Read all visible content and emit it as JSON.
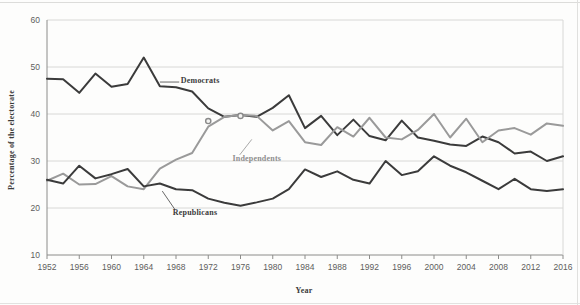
{
  "chart_data": {
    "type": "line",
    "title": "",
    "xlabel": "Year",
    "ylabel": "Percentage of the electorate",
    "xlim": [
      1952,
      2016
    ],
    "ylim": [
      10,
      60
    ],
    "yticks": [
      10,
      20,
      30,
      40,
      50,
      60
    ],
    "xticks": [
      1952,
      1956,
      1960,
      1964,
      1968,
      1972,
      1976,
      1980,
      1984,
      1988,
      1992,
      1996,
      2000,
      2004,
      2008,
      2012,
      2016
    ],
    "grid": "horizontal",
    "legend_position": "inline-annotations",
    "x": [
      1952,
      1954,
      1956,
      1958,
      1960,
      1962,
      1964,
      1966,
      1968,
      1970,
      1972,
      1974,
      1976,
      1978,
      1980,
      1982,
      1984,
      1986,
      1988,
      1990,
      1992,
      1994,
      1996,
      1998,
      2000,
      2002,
      2004,
      2006,
      2008,
      2010,
      2012,
      2014,
      2016
    ],
    "series": [
      {
        "name": "Democrats",
        "color": "#3b3b3b",
        "values": [
          47.5,
          47.4,
          44.5,
          48.6,
          45.8,
          46.4,
          52.0,
          45.9,
          45.7,
          44.8,
          41.2,
          39.4,
          39.8,
          39.4,
          41.3,
          44.0,
          37.0,
          39.6,
          35.5,
          38.8,
          35.3,
          34.4,
          38.6,
          35.0,
          34.3,
          33.5,
          33.2,
          35.2,
          34.0,
          31.6,
          32.0,
          30.0,
          31.0
        ]
      },
      {
        "name": "Independents",
        "color": "#9a9a9a",
        "values": [
          25.8,
          27.3,
          25.0,
          25.1,
          26.8,
          24.6,
          24.0,
          28.4,
          30.3,
          31.7,
          37.3,
          39.4,
          39.8,
          39.6,
          36.5,
          38.5,
          34.0,
          33.4,
          37.2,
          35.2,
          39.2,
          35.0,
          34.6,
          36.6,
          40.0,
          35.0,
          39.0,
          34.0,
          36.5,
          37.0,
          35.6,
          38.0,
          37.5
        ]
      },
      {
        "name": "Republicans",
        "color": "#3b3b3b",
        "values": [
          26.0,
          25.2,
          29.0,
          26.3,
          27.2,
          28.3,
          24.6,
          25.2,
          24.0,
          23.8,
          22.0,
          21.1,
          20.5,
          21.2,
          22.0,
          24.0,
          28.2,
          26.6,
          27.8,
          26.0,
          25.2,
          30.0,
          27.0,
          27.8,
          31.0,
          29.0,
          27.6,
          25.8,
          24.0,
          26.2,
          24.0,
          23.6,
          24.0
        ]
      }
    ],
    "annotations": [
      {
        "name": "Democrats",
        "x": 1967,
        "y": 47.4,
        "color": "#3b3b3b",
        "leader": true
      },
      {
        "name": "Independents",
        "x": 1978.5,
        "y": 31.5,
        "color": "#8f8f8f",
        "leader": true
      },
      {
        "name": "Republicans",
        "x": 1968.5,
        "y": 19.0,
        "color": "#3b3b3b",
        "leader": true
      }
    ],
    "markers": [
      {
        "x": 1972,
        "y": 38.5
      },
      {
        "x": 1976,
        "y": 39.6
      }
    ]
  },
  "labels": {
    "y_axis_title": "Percentage of the electorate",
    "x_axis_title": "Year",
    "series_democrats": "Democrats",
    "series_independents": "Independents",
    "series_republicans": "Republicans",
    "ytick_10": "10",
    "ytick_20": "20",
    "ytick_30": "30",
    "ytick_40": "40",
    "ytick_50": "50",
    "ytick_60": "60",
    "xtick_1952": "1952",
    "xtick_1956": "1956",
    "xtick_1960": "1960",
    "xtick_1964": "1964",
    "xtick_1968": "1968",
    "xtick_1972": "1972",
    "xtick_1976": "1976",
    "xtick_1980": "1980",
    "xtick_1984": "1984",
    "xtick_1988": "1988",
    "xtick_1992": "1992",
    "xtick_1996": "1996",
    "xtick_2000": "2000",
    "xtick_2004": "2004",
    "xtick_2008": "2008",
    "xtick_2012": "2012",
    "xtick_2016": "2016"
  },
  "colors": {
    "dark_line": "#3b3b3b",
    "light_line": "#9a9a9a",
    "grid": "#d8d8d6",
    "axis": "#8c8c8a",
    "background": "#fdfdfc"
  }
}
